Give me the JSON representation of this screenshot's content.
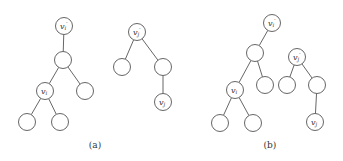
{
  "figure": {
    "panels": [
      {
        "caption": "(a)",
        "caption_pos": [
          95,
          148
        ],
        "trees": [
          {
            "nodes": [
              {
                "id": "a1",
                "x": 64,
                "y": 26,
                "label": "v",
                "sub": "i",
                "prime": true
              },
              {
                "id": "a2",
                "x": 63,
                "y": 60
              },
              {
                "id": "a3",
                "x": 45,
                "y": 91,
                "label": "v",
                "sub": "i"
              },
              {
                "id": "a4",
                "x": 85,
                "y": 91
              },
              {
                "id": "a5",
                "x": 27,
                "y": 122
              },
              {
                "id": "a6",
                "x": 60,
                "y": 122
              }
            ],
            "edges": [
              [
                "a1",
                "a2"
              ],
              [
                "a2",
                "a3"
              ],
              [
                "a2",
                "a4"
              ],
              [
                "a3",
                "a5"
              ],
              [
                "a3",
                "a6"
              ]
            ]
          },
          {
            "nodes": [
              {
                "id": "a7",
                "x": 137,
                "y": 32,
                "label": "v",
                "sub": "j",
                "prime": true
              },
              {
                "id": "a8",
                "x": 122,
                "y": 67
              },
              {
                "id": "a9",
                "x": 163,
                "y": 67
              },
              {
                "id": "a10",
                "x": 163,
                "y": 102,
                "label": "v",
                "sub": "j"
              }
            ],
            "edges": [
              [
                "a7",
                "a8"
              ],
              [
                "a7",
                "a9"
              ],
              [
                "a9",
                "a10"
              ]
            ]
          }
        ]
      },
      {
        "caption": "(b)",
        "caption_pos": [
          270,
          148
        ],
        "trees": [
          {
            "nodes": [
              {
                "id": "b1",
                "x": 272,
                "y": 23,
                "label": "v",
                "sub": "i",
                "prime": true
              },
              {
                "id": "b2",
                "x": 255,
                "y": 53
              },
              {
                "id": "b3",
                "x": 235,
                "y": 90,
                "label": "v",
                "sub": "i"
              },
              {
                "id": "b4",
                "x": 265,
                "y": 85
              },
              {
                "id": "b5",
                "x": 220,
                "y": 123
              },
              {
                "id": "b6",
                "x": 253,
                "y": 123
              }
            ],
            "edges": [
              [
                "b1",
                "b2"
              ],
              [
                "b2",
                "b3"
              ],
              [
                "b2",
                "b4"
              ],
              [
                "b3",
                "b5"
              ],
              [
                "b3",
                "b6"
              ]
            ]
          },
          {
            "nodes": [
              {
                "id": "b7",
                "x": 297,
                "y": 57,
                "label": "v",
                "sub": "j",
                "prime": true
              },
              {
                "id": "b8",
                "x": 287,
                "y": 85
              },
              {
                "id": "b9",
                "x": 317,
                "y": 85
              },
              {
                "id": "b10",
                "x": 315,
                "y": 122,
                "label": "v",
                "sub": "j"
              }
            ],
            "edges": [
              [
                "b7",
                "b8"
              ],
              [
                "b7",
                "b9"
              ],
              [
                "b9",
                "b10"
              ]
            ]
          }
        ]
      }
    ],
    "node_radius": 8.5,
    "colors": {
      "stroke": "#555555",
      "text": "#333333",
      "background": "#ffffff"
    }
  }
}
